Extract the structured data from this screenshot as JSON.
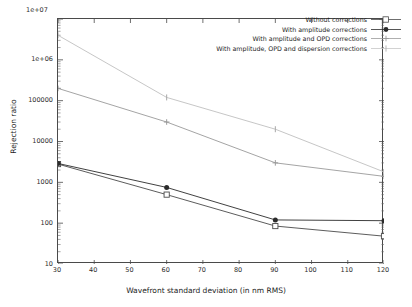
{
  "chart_data": {
    "type": "line",
    "title": "",
    "xlabel": "Wavefront standard deviation (in nm RMS)",
    "ylabel": "Rejection ratio",
    "x": [
      30,
      60,
      90,
      120
    ],
    "xlim": [
      30,
      120
    ],
    "ylim": [
      10,
      10000000
    ],
    "yscale": "log",
    "xticks": [
      "30",
      "40",
      "50",
      "60",
      "70",
      "80",
      "90",
      "100",
      "110",
      "120"
    ],
    "xtick_values": [
      30,
      40,
      50,
      60,
      70,
      80,
      90,
      100,
      110,
      120
    ],
    "yticks": [
      "1e+07",
      "1e+06",
      "100000",
      "10000",
      "1000",
      "100",
      "10"
    ],
    "ytick_values": [
      10000000,
      1000000,
      100000,
      10000,
      1000,
      100,
      10
    ],
    "y_exponent_label": "1e+07",
    "grid": false,
    "legend_position": "top-right",
    "series": [
      {
        "name": "Without corrections",
        "marker": "open-square",
        "color": "#4a4a4a",
        "values": [
          2800,
          500,
          85,
          48
        ]
      },
      {
        "name": "With amplitude corrections",
        "marker": "filled-circle",
        "color": "#2b2b2b",
        "values": [
          2900,
          750,
          120,
          115
        ]
      },
      {
        "name": "With amplitude and OPD corrections",
        "marker": "plus",
        "color": "#9a9a9a",
        "values": [
          200000,
          30000,
          3000,
          1400
        ]
      },
      {
        "name": "With amplitude, OPD and dispersion corrections",
        "marker": "cross",
        "color": "#bfbfbf",
        "values": [
          4000000,
          120000,
          20000,
          1800
        ]
      }
    ]
  },
  "axes": {
    "x_title": "Wavefront standard deviation (in nm RMS)",
    "y_title": "Rejection ratio"
  }
}
